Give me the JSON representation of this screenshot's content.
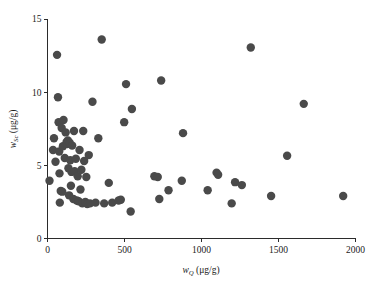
{
  "chart_data": {
    "type": "scatter",
    "title": "",
    "xlabel": "w_Q (μg/g)",
    "ylabel": "w_Sc (μg/g)",
    "xlabel_symbol": "w",
    "xlabel_subscript": "Q",
    "xlabel_unit": "(μg/g)",
    "ylabel_symbol": "w",
    "ylabel_subscript": "Sc",
    "ylabel_unit": "(μg/g)",
    "xlim": [
      0,
      2000
    ],
    "ylim": [
      0,
      15
    ],
    "xticks": [
      0,
      500,
      1000,
      1500,
      2000
    ],
    "yticks": [
      0,
      5,
      10,
      15
    ],
    "xticklabels": [
      "0",
      "500",
      "1000",
      "1500",
      "2000"
    ],
    "yticklabels": [
      "0",
      "5",
      "10",
      "15"
    ],
    "grid": false,
    "legend": null,
    "marker": "circle",
    "marker_color": "#4a4a4a",
    "marker_size": 4.2,
    "n_points": 78,
    "points": [
      [
        13,
        3.95
      ],
      [
        36,
        6.05
      ],
      [
        42,
        6.85
      ],
      [
        52,
        5.25
      ],
      [
        62,
        12.55
      ],
      [
        68,
        9.65
      ],
      [
        72,
        7.95
      ],
      [
        76,
        5.95
      ],
      [
        78,
        4.45
      ],
      [
        80,
        2.45
      ],
      [
        86,
        3.25
      ],
      [
        92,
        7.55
      ],
      [
        96,
        3.2
      ],
      [
        100,
        6.3
      ],
      [
        104,
        8.1
      ],
      [
        112,
        5.5
      ],
      [
        118,
        7.25
      ],
      [
        124,
        6.6
      ],
      [
        128,
        6.45
      ],
      [
        132,
        6.7
      ],
      [
        136,
        4.8
      ],
      [
        140,
        2.95
      ],
      [
        144,
        6.55
      ],
      [
        148,
        5.35
      ],
      [
        152,
        3.6
      ],
      [
        156,
        4.55
      ],
      [
        160,
        6.35
      ],
      [
        168,
        2.7
      ],
      [
        172,
        7.35
      ],
      [
        176,
        4.6
      ],
      [
        184,
        5.45
      ],
      [
        190,
        2.6
      ],
      [
        196,
        4.25
      ],
      [
        202,
        2.55
      ],
      [
        208,
        6.05
      ],
      [
        214,
        3.35
      ],
      [
        220,
        4.7
      ],
      [
        226,
        2.4
      ],
      [
        232,
        7.35
      ],
      [
        238,
        5.3
      ],
      [
        246,
        2.5
      ],
      [
        252,
        4.2
      ],
      [
        258,
        2.35
      ],
      [
        268,
        5.7
      ],
      [
        276,
        2.4
      ],
      [
        292,
        9.35
      ],
      [
        312,
        2.45
      ],
      [
        330,
        6.85
      ],
      [
        352,
        13.6
      ],
      [
        368,
        2.4
      ],
      [
        398,
        3.8
      ],
      [
        420,
        2.45
      ],
      [
        462,
        2.6
      ],
      [
        476,
        2.65
      ],
      [
        498,
        7.95
      ],
      [
        510,
        10.55
      ],
      [
        540,
        1.85
      ],
      [
        548,
        8.85
      ],
      [
        694,
        4.25
      ],
      [
        716,
        4.2
      ],
      [
        726,
        2.7
      ],
      [
        738,
        10.8
      ],
      [
        786,
        3.3
      ],
      [
        872,
        3.95
      ],
      [
        880,
        7.2
      ],
      [
        1040,
        3.3
      ],
      [
        1098,
        4.5
      ],
      [
        1108,
        4.35
      ],
      [
        1196,
        2.4
      ],
      [
        1218,
        3.85
      ],
      [
        1262,
        3.65
      ],
      [
        1320,
        13.05
      ],
      [
        1452,
        2.9
      ],
      [
        1556,
        5.65
      ],
      [
        1664,
        9.2
      ],
      [
        1920,
        2.9
      ]
    ]
  },
  "figure": {
    "background_color": "#ffffff",
    "axis_color": "#2b2b2b"
  }
}
